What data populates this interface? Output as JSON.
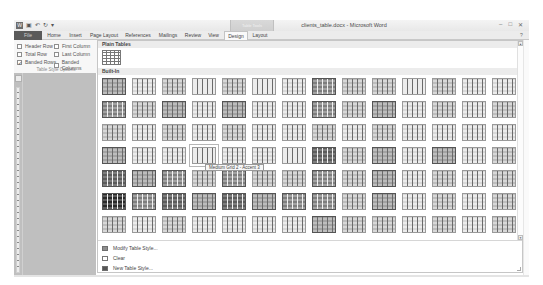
{
  "window": {
    "title": "clients_table.docx - Microsoft Word",
    "context_tab_group": "Table Tools",
    "controls": [
      "minimize",
      "maximize",
      "close"
    ]
  },
  "quick_access": {
    "items": [
      "word-logo",
      "save-icon",
      "undo-icon",
      "redo-icon",
      "customize-icon"
    ]
  },
  "ribbon": {
    "tabs": [
      {
        "label": "File",
        "x": 0,
        "w": 28
      },
      {
        "label": "Home",
        "x": 30,
        "w": 20
      },
      {
        "label": "Insert",
        "x": 51,
        "w": 21
      },
      {
        "label": "Page Layout",
        "x": 73,
        "w": 34
      },
      {
        "label": "References",
        "x": 108,
        "w": 32
      },
      {
        "label": "Mailings",
        "x": 141,
        "w": 26
      },
      {
        "label": "Review",
        "x": 168,
        "w": 22
      },
      {
        "label": "View",
        "x": 191,
        "w": 17
      },
      {
        "label": "Design",
        "x": 210,
        "w": 24
      },
      {
        "label": "Layout",
        "x": 236,
        "w": 20
      }
    ],
    "active_tab": "Design",
    "help": "?"
  },
  "table_style_options": {
    "group_label": "Table Style Options",
    "options": [
      {
        "label": "Header Row",
        "checked": false,
        "x": 3,
        "y": 3
      },
      {
        "label": "First Column",
        "checked": false,
        "x": 40,
        "y": 3
      },
      {
        "label": "Total Row",
        "checked": false,
        "x": 3,
        "y": 11
      },
      {
        "label": "Last Column",
        "checked": false,
        "x": 40,
        "y": 11
      },
      {
        "label": "Banded Rows",
        "checked": true,
        "x": 3,
        "y": 19
      },
      {
        "label": "Banded Columns",
        "checked": false,
        "x": 40,
        "y": 19
      }
    ]
  },
  "gallery": {
    "plain_tables_label": "Plain Tables",
    "built_in_label": "Built-In",
    "tooltip": "Medium Grid 2 - Accent 3",
    "hover_cell": {
      "row": 3,
      "col": 3
    },
    "columns": 14,
    "rows": [
      [
        3,
        1,
        2,
        0,
        2,
        0,
        1,
        4,
        2,
        2,
        0,
        2,
        1,
        1
      ],
      [
        4,
        2,
        3,
        1,
        3,
        1,
        1,
        4,
        2,
        3,
        1,
        2,
        1,
        2
      ],
      [
        2,
        1,
        2,
        1,
        2,
        1,
        1,
        2,
        1,
        2,
        1,
        1,
        1,
        1
      ],
      [
        3,
        1,
        1,
        0,
        1,
        1,
        0,
        5,
        2,
        3,
        1,
        3,
        1,
        2
      ],
      [
        5,
        3,
        4,
        2,
        4,
        2,
        2,
        4,
        2,
        3,
        1,
        2,
        1,
        2
      ],
      [
        6,
        4,
        5,
        3,
        5,
        3,
        4,
        4,
        2,
        3,
        1,
        2,
        1,
        2
      ],
      [
        2,
        1,
        2,
        1,
        1,
        1,
        1,
        3,
        2,
        2,
        1,
        2,
        1,
        2
      ]
    ],
    "menu": [
      {
        "label": "Modify Table Style...",
        "icon": "modify-style-icon"
      },
      {
        "label": "Clear",
        "icon": "clear-icon"
      },
      {
        "label": "New Table Style...",
        "icon": "new-style-icon"
      }
    ]
  },
  "colors": {
    "file_tab": "#5a5a5a",
    "doc_background": "#bfbfbf",
    "tones": [
      "#ececec",
      "#d8d8d8",
      "#bdbdbd",
      "#a2a2a2",
      "#7e7e7e",
      "#5c5c5c",
      "#2a2a2a"
    ]
  }
}
